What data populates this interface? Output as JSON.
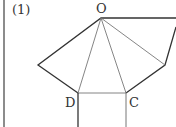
{
  "problem_label": "(1)",
  "vertices": {
    "O": "O",
    "D": "D",
    "C": "C"
  },
  "colors": {
    "edge": "#333333",
    "thin": "#777777",
    "frame": "#666666"
  }
}
